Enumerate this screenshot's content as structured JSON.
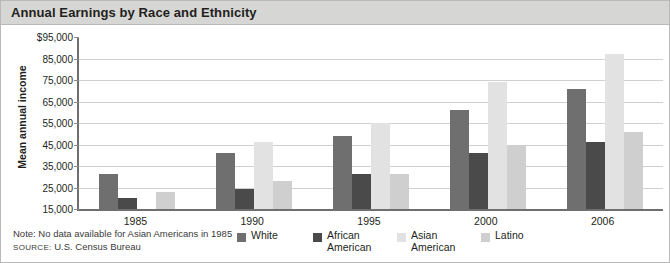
{
  "title": "Annual Earnings by Race and Ethnicity",
  "footer": {
    "note": "Note: No data available for Asian Americans in 1985",
    "source_label": "SOURCE:",
    "source_value": "U.S. Census Bureau"
  },
  "chart_data": {
    "type": "bar",
    "title": "Annual Earnings by Race and Ethnicity",
    "xlabel": "",
    "ylabel": "Mean annual income",
    "categories": [
      "1985",
      "1990",
      "1995",
      "2000",
      "2006"
    ],
    "ylim": [
      15000,
      95000
    ],
    "ytick_labels": [
      "$95,000",
      "85,000",
      "75,000",
      "65,000",
      "55,000",
      "45,000",
      "35,000",
      "25,000",
      "15,000"
    ],
    "ytick_values": [
      95000,
      85000,
      75000,
      65000,
      55000,
      45000,
      35000,
      25000,
      15000
    ],
    "grid": true,
    "legend_position": "bottom",
    "series": [
      {
        "name": "White",
        "color": "#6f6f6f",
        "values": [
          31500,
          41000,
          49000,
          61000,
          71000
        ]
      },
      {
        "name": "African American",
        "color": "#4a4a4a",
        "values": [
          20000,
          24500,
          31500,
          41000,
          46000
        ]
      },
      {
        "name": "Asian American",
        "color": "#e2e2e2",
        "values": [
          null,
          46000,
          55000,
          74000,
          87000
        ]
      },
      {
        "name": "Latino",
        "color": "#cfcfcf",
        "values": [
          23000,
          28000,
          31500,
          45000,
          51000
        ]
      }
    ],
    "legend": [
      {
        "label": "White",
        "color": "#6f6f6f"
      },
      {
        "label": "African\nAmerican",
        "color": "#4a4a4a"
      },
      {
        "label": "Asian\nAmerican",
        "color": "#e2e2e2"
      },
      {
        "label": "Latino",
        "color": "#cfcfcf"
      }
    ]
  }
}
